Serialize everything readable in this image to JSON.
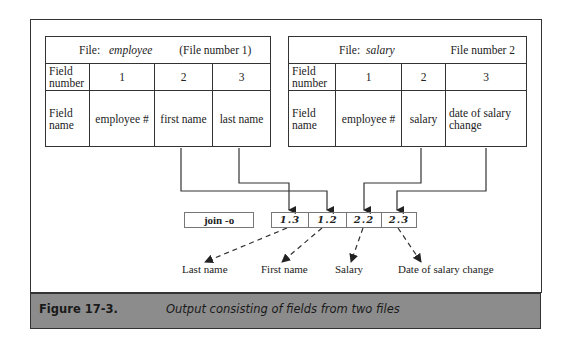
{
  "left_table": {
    "file_label": "File:",
    "file_name": "employee",
    "file_number_text": "(File  number  1)",
    "row_field_number_label": "Field number",
    "row_field_name_label": "Field name",
    "field_numbers": [
      "1",
      "2",
      "3"
    ],
    "field_names": [
      "employee #",
      "first name",
      "last name"
    ]
  },
  "right_table": {
    "file_label": "File:",
    "file_name": "salary",
    "file_number_text": "File number  2",
    "row_field_number_label": "Field number",
    "row_field_name_label": "Field name",
    "field_numbers": [
      "1",
      "2",
      "3"
    ],
    "field_names": [
      "employee #",
      "salary",
      "date of salary change"
    ]
  },
  "command": {
    "label": "join  -o",
    "fields": [
      "1.3",
      "1.2",
      "2.2",
      "2.3"
    ]
  },
  "outputs": [
    "Last name",
    "First name",
    "Salary",
    "Date of salary change"
  ],
  "caption": {
    "number": "Figure 17-3.",
    "text": "Output consisting of fields from two files"
  },
  "colors": {
    "line": "#333333",
    "caption_bg": "#8c8c8c"
  }
}
